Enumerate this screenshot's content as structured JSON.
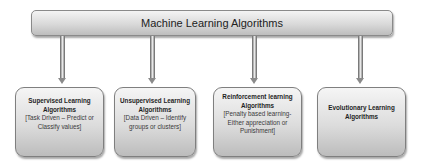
{
  "diagram": {
    "root": {
      "label": "Machine Learning Algorithms"
    },
    "children": [
      {
        "title": "Supervised Learning Algorithms",
        "description": "[Task Driven – Predict or Classify values]"
      },
      {
        "title": "Unsupervised Learning Algorithms",
        "description": "[Data Driven – Identify groups or clusters]"
      },
      {
        "title": "Reinforcement learning Algorithms",
        "description": "[Penalty based learning- Either appreciation or Punishment]"
      },
      {
        "title": "Evolutionary Learning Algorithms",
        "description": ""
      }
    ],
    "colors": {
      "box_fill_top": "#f5f5f5",
      "box_fill_bottom": "#bcbcbc",
      "border": "#7f7f7f",
      "arrow": "#9a9a9a"
    }
  }
}
